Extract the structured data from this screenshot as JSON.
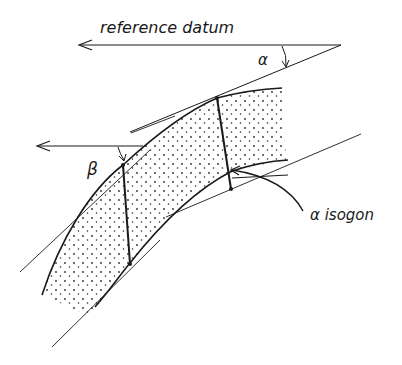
{
  "diagram": {
    "type": "fold-layer-dip-isogon",
    "labels": {
      "reference_datum": "reference  datum",
      "alpha": "α",
      "beta": "β",
      "alpha_isogon": "α isogon"
    },
    "colors": {
      "ink": "#1a1a1a",
      "fill_dots": "#2a2a2a",
      "background": "#ffffff"
    }
  }
}
